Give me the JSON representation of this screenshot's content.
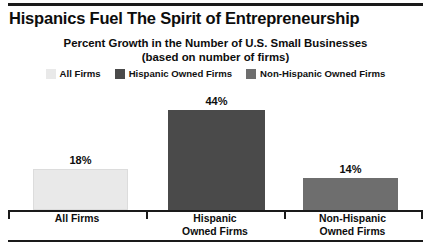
{
  "chart_data": {
    "type": "bar",
    "title": "Hispanics Fuel The Spirit of Entrepreneurship",
    "subtitle_line1": "Percent Growth in the Number of U.S. Small Businesses",
    "subtitle_line2": "(based on number of firms)",
    "xlabel": "",
    "ylabel": "",
    "ylim": [
      0,
      50
    ],
    "grid": false,
    "legend_position": "top-center",
    "categories": [
      "All Firms",
      "Hispanic Owned Firms",
      "Non-Hispanic Owned Firms"
    ],
    "category_label_lines": [
      [
        "All Firms"
      ],
      [
        "Hispanic",
        "Owned Firms"
      ],
      [
        "Non-Hispanic",
        "Owned Firms"
      ]
    ],
    "values": [
      18,
      44,
      14
    ],
    "value_labels": [
      "18%",
      "44%",
      "14%"
    ],
    "colors": [
      "#e9e9e9",
      "#4a4a4a",
      "#6e6e6e"
    ],
    "legend": [
      {
        "label": "All Firms",
        "color": "#e9e9e9"
      },
      {
        "label": "Hispanic Owned Firms",
        "color": "#4a4a4a"
      },
      {
        "label": "Non-Hispanic Owned Firms",
        "color": "#6e6e6e"
      }
    ]
  }
}
